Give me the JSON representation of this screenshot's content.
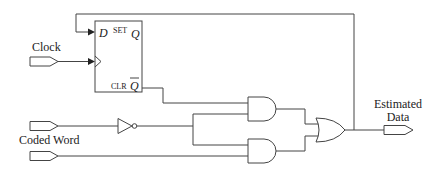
{
  "diagram": {
    "type": "logic-circuit",
    "inputs": {
      "clock": "Clock",
      "coded_word": "Coded Word"
    },
    "output": {
      "line1": "Estimated",
      "line2": "Data"
    },
    "flip_flop": {
      "d_label": "D",
      "set_label": "SET",
      "q_label": "Q",
      "clr_label": "CLR",
      "qbar_label": "Q"
    },
    "gates": [
      {
        "id": "inv1",
        "type": "NOT"
      },
      {
        "id": "and1",
        "type": "AND"
      },
      {
        "id": "and2",
        "type": "AND"
      },
      {
        "id": "or1",
        "type": "OR"
      }
    ],
    "colors": {
      "line": "#444444",
      "text": "#222222",
      "background": "#ffffff"
    }
  }
}
